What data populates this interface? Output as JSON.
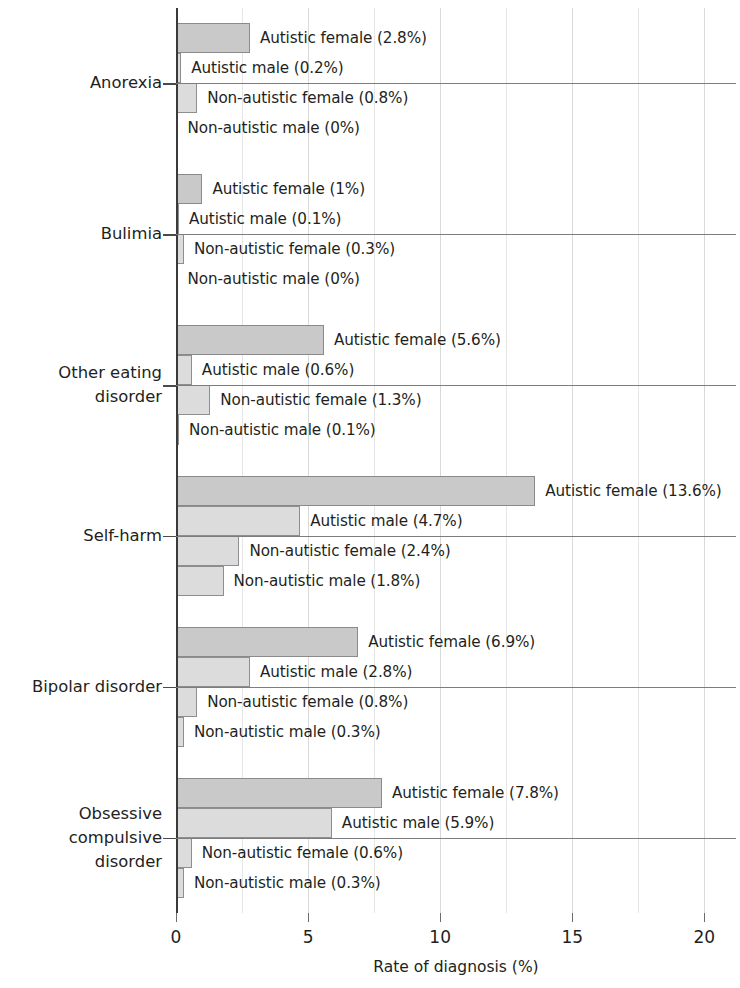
{
  "chart_data": {
    "type": "bar",
    "orientation": "horizontal",
    "title": "",
    "xlabel": "Rate of diagnosis (%)",
    "ylabel": "",
    "xlim": [
      0,
      21.2
    ],
    "xticks": [
      0,
      5,
      10,
      15,
      20
    ],
    "xtick_labels": [
      "0",
      "5",
      "10",
      "15",
      "20"
    ],
    "grid": "vertical-minor-and-major",
    "legend": "inline-data-labels",
    "categories": [
      "Anorexia",
      "Bulimia",
      "Other eating\ndisorder",
      "Self-harm",
      "Bipolar disorder",
      "Obsessive\ncompulsive\ndisorder"
    ],
    "series": [
      {
        "name": "Autistic female",
        "color": "#c9c9c9",
        "values": [
          2.8,
          1,
          5.6,
          13.6,
          6.9,
          7.8
        ]
      },
      {
        "name": "Autistic male",
        "color": "#dcdcdc",
        "values": [
          0.2,
          0.1,
          0.6,
          4.7,
          2.8,
          5.9
        ]
      },
      {
        "name": "Non-autistic female",
        "color": "#dcdcdc",
        "values": [
          0.8,
          0.3,
          1.3,
          2.4,
          0.8,
          0.6
        ]
      },
      {
        "name": "Non-autistic male",
        "color": "#dcdcdc",
        "values": [
          0,
          0,
          0.1,
          1.8,
          0.3,
          0.3
        ]
      }
    ],
    "groups": [
      {
        "category": "Anorexia",
        "bars": [
          {
            "label": "Autistic female (2.8%)",
            "value": 2.8,
            "shade": "dark"
          },
          {
            "label": "Autistic male (0.2%)",
            "value": 0.2,
            "shade": "light"
          },
          {
            "label": "Non-autistic female (0.8%)",
            "value": 0.8,
            "shade": "light"
          },
          {
            "label": "Non-autistic male (0%)",
            "value": 0,
            "shade": "light"
          }
        ]
      },
      {
        "category": "Bulimia",
        "bars": [
          {
            "label": "Autistic female (1%)",
            "value": 1,
            "shade": "dark"
          },
          {
            "label": "Autistic male (0.1%)",
            "value": 0.1,
            "shade": "light"
          },
          {
            "label": "Non-autistic female (0.3%)",
            "value": 0.3,
            "shade": "light"
          },
          {
            "label": "Non-autistic male (0%)",
            "value": 0,
            "shade": "light"
          }
        ]
      },
      {
        "category": "Other eating\ndisorder",
        "bars": [
          {
            "label": "Autistic female (5.6%)",
            "value": 5.6,
            "shade": "dark"
          },
          {
            "label": "Autistic male (0.6%)",
            "value": 0.6,
            "shade": "light"
          },
          {
            "label": "Non-autistic female (1.3%)",
            "value": 1.3,
            "shade": "light"
          },
          {
            "label": "Non-autistic male (0.1%)",
            "value": 0.1,
            "shade": "light"
          }
        ]
      },
      {
        "category": "Self-harm",
        "bars": [
          {
            "label": "Autistic female (13.6%)",
            "value": 13.6,
            "shade": "dark"
          },
          {
            "label": "Autistic male (4.7%)",
            "value": 4.7,
            "shade": "light"
          },
          {
            "label": "Non-autistic female (2.4%)",
            "value": 2.4,
            "shade": "light"
          },
          {
            "label": "Non-autistic male (1.8%)",
            "value": 1.8,
            "shade": "light"
          }
        ]
      },
      {
        "category": "Bipolar disorder",
        "bars": [
          {
            "label": "Autistic female (6.9%)",
            "value": 6.9,
            "shade": "dark"
          },
          {
            "label": "Autistic male (2.8%)",
            "value": 2.8,
            "shade": "light"
          },
          {
            "label": "Non-autistic female (0.8%)",
            "value": 0.8,
            "shade": "light"
          },
          {
            "label": "Non-autistic male (0.3%)",
            "value": 0.3,
            "shade": "light"
          }
        ]
      },
      {
        "category": "Obsessive\ncompulsive\ndisorder",
        "bars": [
          {
            "label": "Autistic female (7.8%)",
            "value": 7.8,
            "shade": "dark"
          },
          {
            "label": "Autistic male (5.9%)",
            "value": 5.9,
            "shade": "light"
          },
          {
            "label": "Non-autistic female (0.6%)",
            "value": 0.6,
            "shade": "light"
          },
          {
            "label": "Non-autistic male (0.3%)",
            "value": 0.3,
            "shade": "light"
          }
        ]
      }
    ]
  },
  "axis": {
    "x_title": "Rate of diagnosis (%)"
  },
  "colors": {
    "bar_dark": "#c9c9c9",
    "bar_light": "#dcdcdc",
    "bar_border": "#8e8e8e",
    "gridline": "#d9d9d9",
    "axis": "#3a3a3a",
    "text": "#231f20",
    "background": "#ffffff"
  }
}
